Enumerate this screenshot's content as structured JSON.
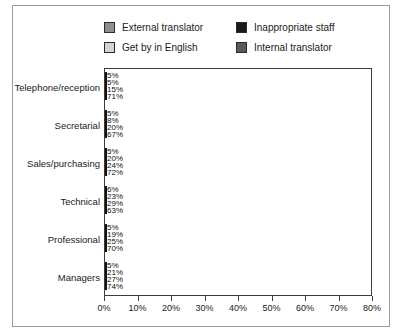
{
  "chart_data": {
    "type": "bar",
    "orientation": "horizontal",
    "title": "",
    "xlabel": "",
    "ylabel": "",
    "xlim": [
      0,
      80
    ],
    "xticks": [
      "0%",
      "10%",
      "20%",
      "30%",
      "40%",
      "50%",
      "60%",
      "70%",
      "80%"
    ],
    "grid": false,
    "legend_position": "top",
    "categories": [
      "Telephone/reception",
      "Secretarial",
      "Sales/purchasing",
      "Technical",
      "Professional",
      "Managers"
    ],
    "series": [
      {
        "name": "Get by in English",
        "color": "#d4d4d4",
        "values": [
          5,
          5,
          5,
          6,
          5,
          5
        ],
        "labels": [
          "5%",
          "5%",
          "5%",
          "6%",
          "5%",
          "5%"
        ]
      },
      {
        "name": "External translator",
        "color": "#8f8f8f",
        "values": [
          5,
          8,
          20,
          23,
          19,
          21
        ],
        "labels": [
          "5%",
          "8%",
          "20%",
          "23%",
          "19%",
          "21%"
        ]
      },
      {
        "name": "Internal translator",
        "color": "#5a5a5a",
        "values": [
          15,
          20,
          24,
          29,
          25,
          27
        ],
        "labels": [
          "15%",
          "20%",
          "24%",
          "29%",
          "25%",
          "27%"
        ]
      },
      {
        "name": "Inappropriate staff",
        "color": "#1a1a1a",
        "values": [
          71,
          67,
          72,
          63,
          70,
          74
        ],
        "labels": [
          "71%",
          "67%",
          "72%",
          "63%",
          "70%",
          "74%"
        ]
      }
    ]
  },
  "legend": {
    "items": [
      {
        "label": "External translator",
        "color": "#8f8f8f"
      },
      {
        "label": "Get by in English",
        "color": "#d4d4d4"
      },
      {
        "label": "Inappropriate staff",
        "color": "#1a1a1a"
      },
      {
        "label": "Internal translator",
        "color": "#5a5a5a"
      }
    ]
  }
}
